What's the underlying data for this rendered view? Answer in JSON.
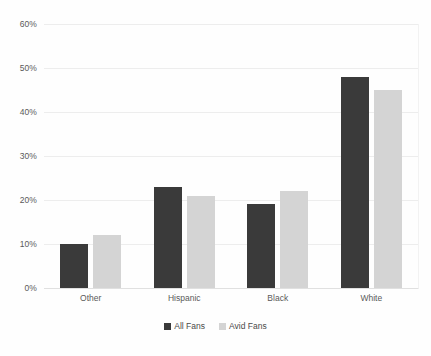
{
  "chart_data": {
    "type": "bar",
    "title": "",
    "subtitle": "",
    "xlabel": "",
    "ylabel": "",
    "categories": [
      "Other",
      "Hispanic",
      "Black",
      "White"
    ],
    "series": [
      {
        "name": "All Fans",
        "color": "#3a3a3a",
        "values": [
          10,
          23,
          19,
          48
        ]
      },
      {
        "name": "Avid Fans",
        "color": "#d4d4d4",
        "values": [
          12,
          21,
          22,
          45
        ]
      }
    ],
    "ylim": [
      0,
      60
    ],
    "ytick_step": 10,
    "ytick_labels": [
      "60%",
      "50%",
      "40%",
      "30%",
      "20%",
      "10%",
      "0%"
    ],
    "ytick_values": [
      60,
      50,
      40,
      30,
      20,
      10,
      0
    ],
    "grid": true,
    "grid_axis": "y",
    "legend_position": "bottom-center",
    "value_format": "percent",
    "background_color": "#fefefe",
    "gridline_color": "#ededed",
    "text_color": "#5a5a5a"
  }
}
